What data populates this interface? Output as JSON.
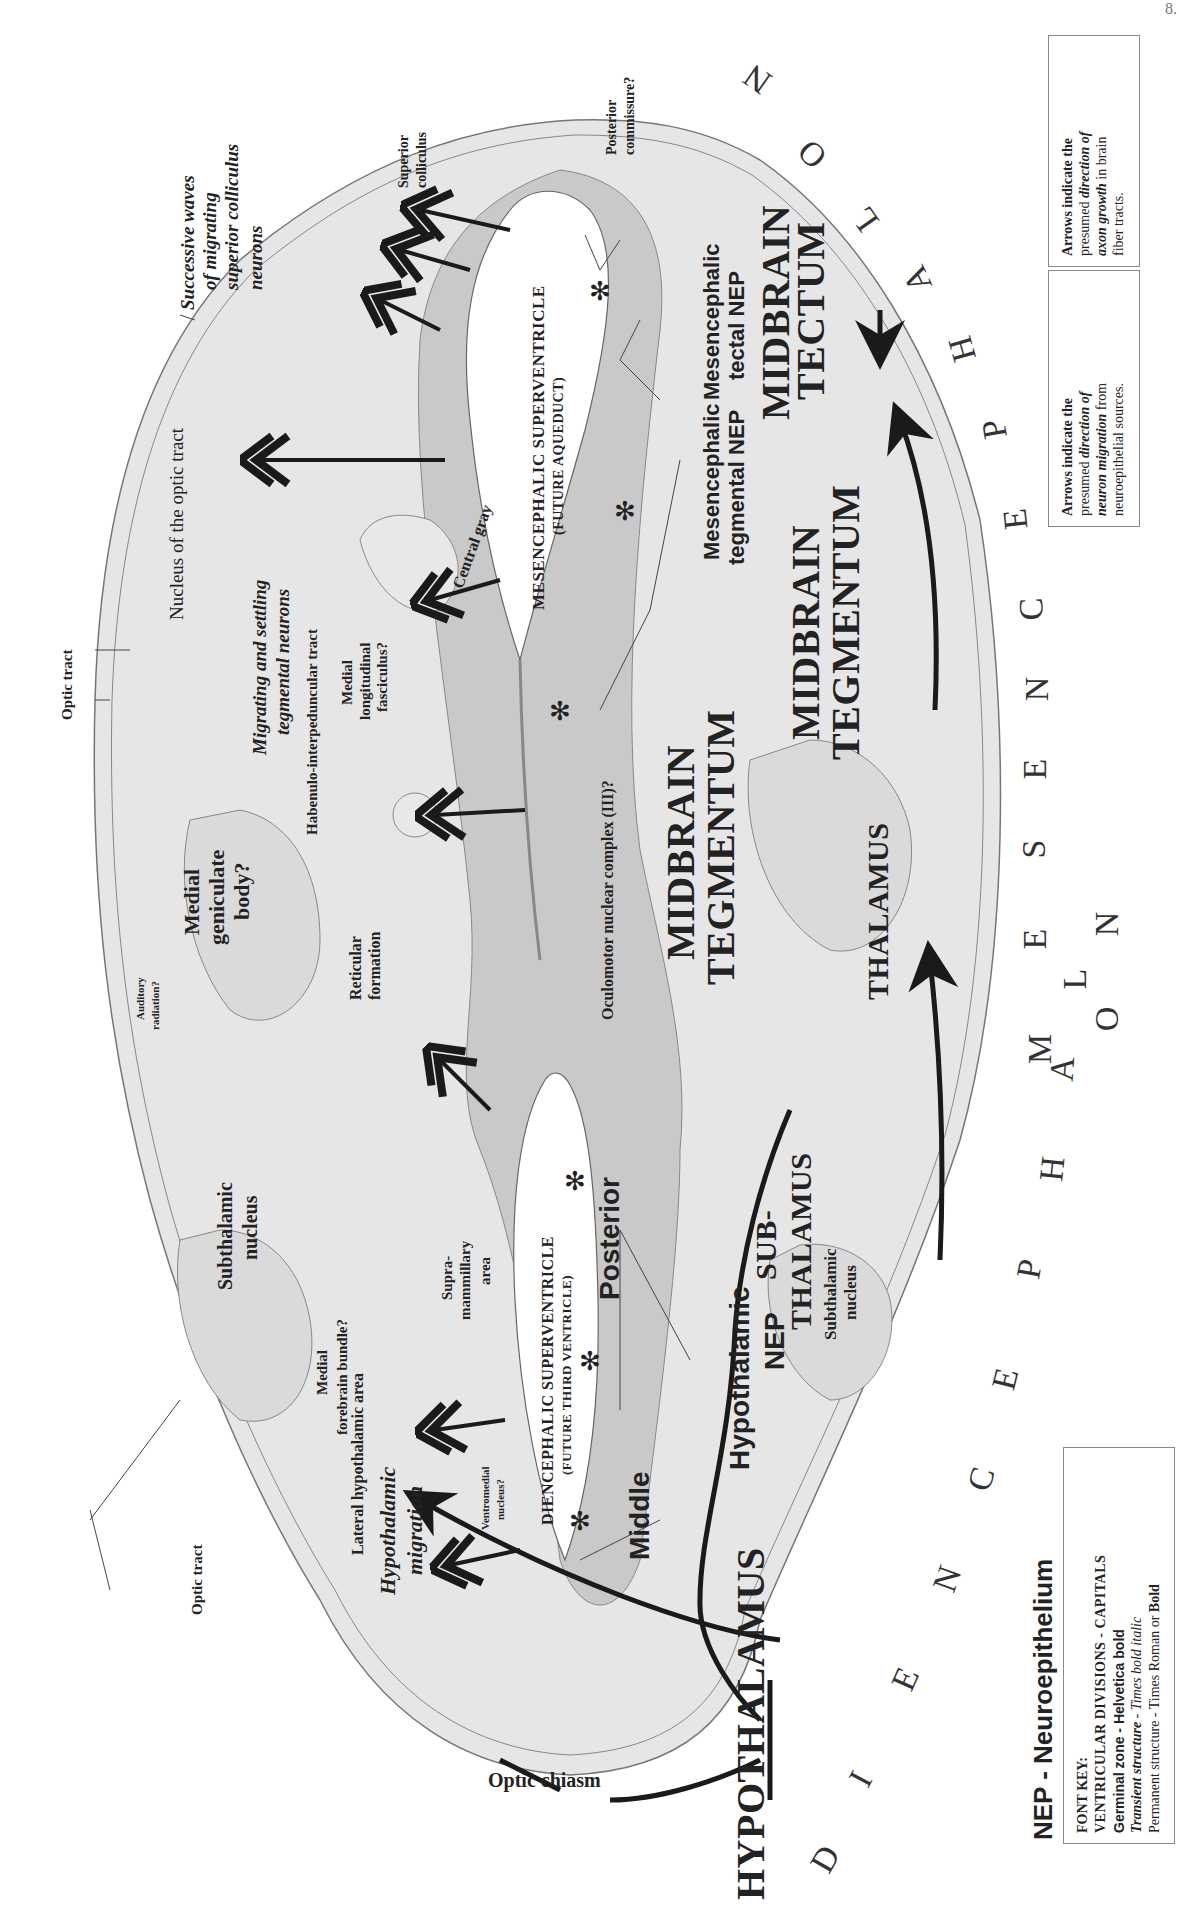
{
  "page_number": "8.",
  "legend": {
    "neuron_migration": {
      "line1": "Arrows indicate the",
      "line2a": "presumed ",
      "line2b": "direction of",
      "line3a": "neuron migration",
      "line3b": " from",
      "line4": "neuroepithelial sources.",
      "icon": "double-headed-open-arrow"
    },
    "axon_growth": {
      "line1": "Arrows indicate the",
      "line2a": "presumed ",
      "line2b": "direction of",
      "line3a": "axon growth",
      "line3b": " in brain",
      "line4": "fiber tracts.",
      "icon": "solid-arrow"
    },
    "nep_title": "NEP - Neuroepithelium",
    "font_key": {
      "title": "FONT KEY:",
      "l1": "VENTRICULAR DIVISIONS - CAPITALS",
      "l2": "Germinal zone - Helvetica bold",
      "l3a": "Transient structure",
      "l3b": " - ",
      "l3c": "Times bold italic",
      "l4a": "Permanent structure - Times Roman or ",
      "l4b": "Bold"
    }
  },
  "arc_labels": {
    "diencephalon": [
      "D",
      "I",
      "E",
      "N",
      "C",
      "E",
      "P",
      "H",
      "A",
      "L",
      "O",
      "N"
    ],
    "mesencephalon": [
      "M",
      "E",
      "S",
      "E",
      "N",
      "C",
      "E",
      "P",
      "H",
      "A",
      "L",
      "O",
      "N"
    ]
  },
  "ventricular_divisions": {
    "hypothalamus": "HYPOTHALAMUS",
    "subthalamus_1": "SUB-",
    "subthalamus_2": "THALAMUS",
    "thalamus": "THALAMUS",
    "midbrain_tegmentum_a1": "MIDBRAIN",
    "midbrain_tegmentum_a2": "TEGMENTUM",
    "midbrain_tegmentum_b1": "MIDBRAIN",
    "midbrain_tegmentum_b2": "TEGMENTUM",
    "midbrain_tectum_1": "MIDBRAIN",
    "midbrain_tectum_2": "TECTUM"
  },
  "ventricles": {
    "mesencephalic_1": "MESENCEPHALIC SUPERVENTRICLE",
    "mesencephalic_2": "(FUTURE AQUEDUCT)",
    "diencephalic_1": "DIENCEPHALIC SUPERVENTRICLE",
    "diencephalic_2": "(FUTURE THIRD VENTRICLE)"
  },
  "germinal_zones": {
    "middle": "Middle",
    "posterior": "Posterior",
    "hypothalamic_nep_1": "Hypothalamic",
    "hypothalamic_nep_2": "NEP",
    "mes_tegmental_1": "Mesencephalic",
    "mes_tegmental_2": "tegmental NEP",
    "mes_tectal_1": "Mesencephalic",
    "mes_tectal_2": "tectal NEP"
  },
  "transient_structures": {
    "sc_waves_1": "Successive waves",
    "sc_waves_2": "of migrating",
    "sc_waves_3": "superior colliculus",
    "sc_waves_4": "neurons",
    "tegmental_1": "Migrating and settling",
    "tegmental_2": "tegmental neurons",
    "hypo_mig_1": "Hypothalamic",
    "hypo_mig_2": "migration"
  },
  "permanent_structures": {
    "nucleus_optic_tract": "Nucleus of the optic tract",
    "optic_tract_top": "Optic tract",
    "optic_tract_bottom": "Optic tract",
    "superior_colliculus_1": "Superior",
    "superior_colliculus_2": "colliculus",
    "posterior_commissure_1": "Posterior",
    "posterior_commissure_2": "commissure?",
    "central_gray": "Central gray",
    "habenulo": "Habenulo-interpeduncular tract",
    "mlf_1": "Medial",
    "mlf_2": "longitudinal",
    "mlf_3": "fasciculus?",
    "oculomotor": "Oculomotor nuclear complex (III)?",
    "mgb_1": "Medial",
    "mgb_2": "geniculate",
    "mgb_3": "body?",
    "reticular_1": "Reticular",
    "reticular_2": "formation",
    "auditory_1": "Auditory",
    "auditory_2": "radiation?",
    "subthalamic_top_1": "Subthalamic",
    "subthalamic_top_2": "nucleus",
    "subthalamic_bottom_1": "Subthalamic",
    "subthalamic_bottom_2": "nucleus",
    "mfb_1": "Medial",
    "mfb_2": "forebrain bundle?",
    "lha": "Lateral hypothalamic area",
    "supramammillary_1": "Supra-",
    "supramammillary_2": "mammillary",
    "supramammillary_3": "area",
    "ventromedial_1": "Ventromedial",
    "ventromedial_2": "nucleus?",
    "optic_chiasm": "Optic chiasm"
  },
  "colors": {
    "tissue_light": "#e4e4e4",
    "tissue_mid": "#d2d2d2",
    "neuroepithelium": "#b9b9b9",
    "outline": "#777777",
    "arrow": "#1a1a1a",
    "ventricle": "#ffffff"
  }
}
